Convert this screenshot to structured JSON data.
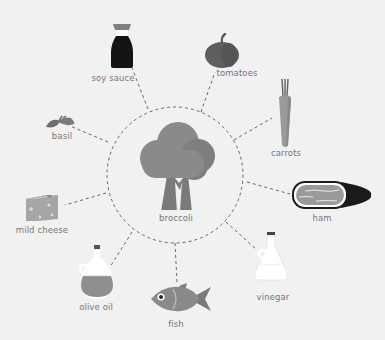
{
  "diagram": {
    "center": {
      "label": "broccoli",
      "icon": "broccoli-icon"
    },
    "nodes": [
      {
        "label": "soy sauce",
        "icon": "soy-sauce-bottle-icon"
      },
      {
        "label": "tomatoes",
        "icon": "tomato-icon"
      },
      {
        "label": "carrots",
        "icon": "carrot-icon"
      },
      {
        "label": "ham",
        "icon": "ham-icon"
      },
      {
        "label": "vinegar",
        "icon": "vinegar-bottle-icon"
      },
      {
        "label": "fish",
        "icon": "fish-icon"
      },
      {
        "label": "olive oil",
        "icon": "olive-oil-bottle-icon"
      },
      {
        "label": "mild cheese",
        "icon": "cheese-icon"
      },
      {
        "label": "basil",
        "icon": "basil-icon"
      }
    ],
    "colors": {
      "background": "#f1f1f1",
      "connector": "#666666",
      "label": "#777777",
      "icon_gray": "#8a8a8a",
      "icon_dark": "#1a1a1a"
    }
  }
}
